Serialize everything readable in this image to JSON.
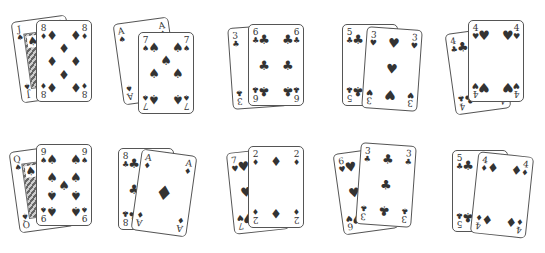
{
  "pairs": [
    {
      "back": {
        "rank": "J",
        "suit": "spades",
        "symbol": "♠"
      },
      "front": {
        "rank": "8",
        "suit": "diamonds",
        "symbol": "♦"
      }
    },
    {
      "back": {
        "rank": "A",
        "suit": "spades",
        "symbol": "♠"
      },
      "front": {
        "rank": "7",
        "suit": "spades",
        "symbol": "♠"
      }
    },
    {
      "back": {
        "rank": "3",
        "suit": "clubs",
        "symbol": "♣"
      },
      "front": {
        "rank": "6",
        "suit": "clubs",
        "symbol": "♣"
      }
    },
    {
      "back": {
        "rank": "5",
        "suit": "clubs",
        "symbol": "♣"
      },
      "front": {
        "rank": "3",
        "suit": "hearts",
        "symbol": "♥"
      }
    },
    {
      "back": {
        "rank": "4",
        "suit": "clubs",
        "symbol": "♣"
      },
      "front": {
        "rank": "4",
        "suit": "hearts",
        "symbol": "♥"
      }
    },
    {
      "back": {
        "rank": "Q",
        "suit": "spades",
        "symbol": "♠"
      },
      "front": {
        "rank": "9",
        "suit": "spades",
        "symbol": "♠"
      }
    },
    {
      "back": {
        "rank": "8",
        "suit": "clubs",
        "symbol": "♣"
      },
      "front": {
        "rank": "A",
        "suit": "diamonds",
        "symbol": "♦"
      }
    },
    {
      "back": {
        "rank": "7",
        "suit": "hearts",
        "symbol": "♥"
      },
      "front": {
        "rank": "2",
        "suit": "diamonds",
        "symbol": "♦"
      }
    },
    {
      "back": {
        "rank": "6",
        "suit": "hearts",
        "symbol": "♥"
      },
      "front": {
        "rank": "3",
        "suit": "clubs",
        "symbol": "♣"
      }
    },
    {
      "back": {
        "rank": "5",
        "suit": "clubs",
        "symbol": "♣"
      },
      "front": {
        "rank": "4",
        "suit": "diamonds",
        "symbol": "♦"
      }
    }
  ],
  "colors": {
    "ink": "#333333",
    "border": "#555555",
    "background": "#ffffff"
  }
}
